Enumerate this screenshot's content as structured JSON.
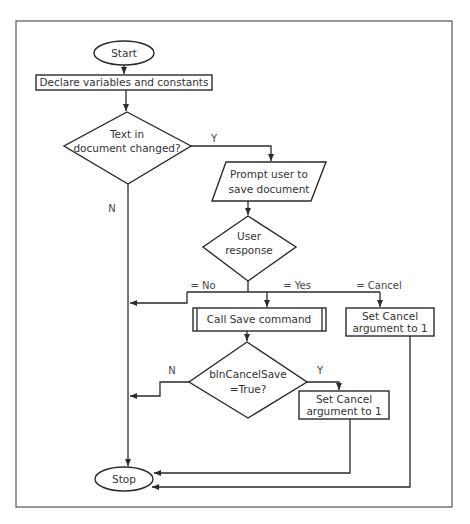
{
  "diagram": {
    "type": "flowchart",
    "nodes": {
      "start": {
        "shape": "terminator",
        "text": "Start"
      },
      "declare": {
        "shape": "process",
        "text": "Declare variables and constants"
      },
      "text_changed": {
        "shape": "decision",
        "line1": "Text in",
        "line2": "document changed?"
      },
      "prompt": {
        "shape": "input-output",
        "line1": "Prompt user to",
        "line2": "save document"
      },
      "user_response": {
        "shape": "decision",
        "line1": "User",
        "line2": "response"
      },
      "call_save": {
        "shape": "predefined-process",
        "text": "Call Save command"
      },
      "set_cancel_1": {
        "shape": "process",
        "line1": "Set Cancel",
        "line2": "argument to 1"
      },
      "cancel_save": {
        "shape": "decision",
        "line1": "blnCancelSave",
        "line2": "=True?"
      },
      "set_cancel_2": {
        "shape": "process",
        "line1": "Set Cancel",
        "line2": "argument to 1"
      },
      "stop": {
        "shape": "terminator",
        "text": "Stop"
      }
    },
    "edge_labels": {
      "text_changed_yes": "Y",
      "text_changed_no": "N",
      "response_no": "= No",
      "response_yes": "= Yes",
      "response_cancel": "= Cancel",
      "cancel_save_no": "N",
      "cancel_save_yes": "Y"
    },
    "edges": [
      {
        "from": "start",
        "to": "declare"
      },
      {
        "from": "declare",
        "to": "text_changed"
      },
      {
        "from": "text_changed",
        "to": "prompt",
        "label": "Y"
      },
      {
        "from": "text_changed",
        "to": "stop",
        "label": "N"
      },
      {
        "from": "prompt",
        "to": "user_response"
      },
      {
        "from": "user_response",
        "to": "stop",
        "label": "= No"
      },
      {
        "from": "user_response",
        "to": "call_save",
        "label": "= Yes"
      },
      {
        "from": "user_response",
        "to": "set_cancel_1",
        "label": "= Cancel"
      },
      {
        "from": "call_save",
        "to": "cancel_save"
      },
      {
        "from": "cancel_save",
        "to": "stop",
        "label": "N"
      },
      {
        "from": "cancel_save",
        "to": "set_cancel_2",
        "label": "Y"
      },
      {
        "from": "set_cancel_2",
        "to": "stop"
      },
      {
        "from": "set_cancel_1",
        "to": "stop"
      }
    ]
  }
}
